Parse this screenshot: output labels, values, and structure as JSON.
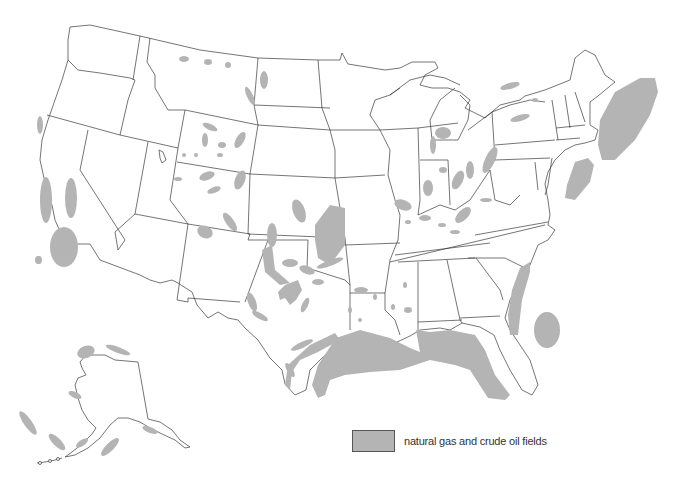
{
  "map": {
    "title": "",
    "subject": "United States natural gas and crude oil fields",
    "regions": [
      "contiguous-us",
      "alaska",
      "offshore-atlantic",
      "offshore-gulf",
      "offshore-pacific"
    ],
    "colors": {
      "field_fill": "#b4b4b4",
      "state_border": "#3a3a3a",
      "land": "#ffffff"
    }
  },
  "legend": {
    "items": [
      {
        "label": "natural gas and crude oil fields",
        "color": "#b4b4b4"
      }
    ]
  }
}
